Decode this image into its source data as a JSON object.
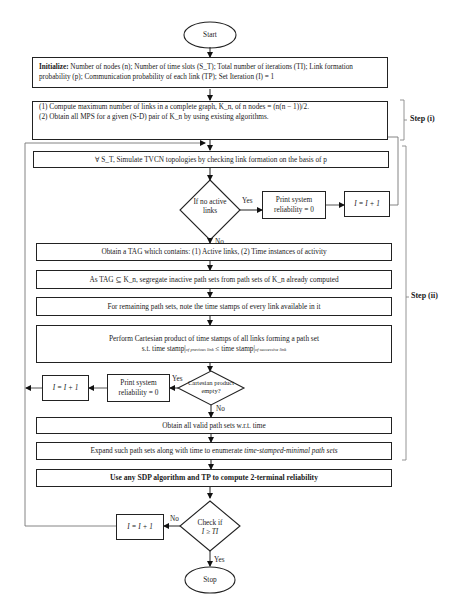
{
  "flowchart": {
    "start": "Start",
    "stop": "Stop",
    "init": {
      "label": "Initialize:",
      "text": "Number of nodes (n); Number of time slots (S_T); Total number of iterations (TI); Link formation probability (p); Communication probability of each link (TP); Set Iteration (I) = 1"
    },
    "step1_box": {
      "line1": "(1) Compute maximum number of links in a complete graph, K_n, of n nodes = (n(n − 1))/2.",
      "line2": "(2) Obtain all MPS for a given (S-D) pair of K_n by using existing algorithms."
    },
    "simulate": "∀ S_T, Simulate TVCN topologies by checking link formation on the basis of p",
    "decision1": "If no active links",
    "decision1_yes": "Yes",
    "decision1_no": "No",
    "print1": "Print system reliability = 0",
    "incr1": "I = I + 1",
    "tag": "Obtain a TAG which contains: (1) Active links, (2) Time instances of activity",
    "segregate": "As TAG ⊆ K_n, segregate inactive path sets from path sets of K_n already computed",
    "remaining": "For remaining path sets, note the time stamps of every link available in it",
    "cartesian": {
      "line1": "Perform Cartesian product of time stamps of all links forming a path set",
      "line2_prefix": "s.t. time stamp|",
      "line2_sub1": "of previous link",
      "line2_mid": " ≤ time stamp|",
      "line2_sub2": "of successive link"
    },
    "decision2": "Cartesian product empty?",
    "decision2_yes": "Yes",
    "decision2_no": "No",
    "print2": "Print system reliability = 0",
    "incr2": "I = I + 1",
    "valid": "Obtain all valid path sets w.r.t. time",
    "expand_prefix": "Expand such path sets along with time to enumerate ",
    "expand_italic": "time-stamped-minimal path sets",
    "sdp": "Use any SDP algorithm and TP to compute 2-terminal reliability",
    "decision3_line1": "Check if",
    "decision3_line2": "I ≥ TI",
    "decision3_yes": "Yes",
    "decision3_no": "No",
    "incr3": "I = I + 1",
    "step1_label": "Step (i)",
    "step2_label": "Step (ii)"
  },
  "colors": {
    "stroke": "#222222",
    "bracket": "#888888",
    "loop": "#777777"
  }
}
